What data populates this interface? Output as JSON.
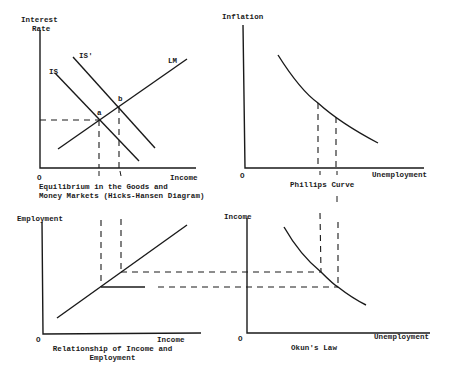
{
  "panels": {
    "hicks_hansen": {
      "y_axis_label_line1": "Interest",
      "y_axis_label_line2": "Rate",
      "x_axis_label": "Income",
      "origin": "O",
      "curves": {
        "is": "IS",
        "is_shifted": "IS'",
        "lm": "LM"
      },
      "points": {
        "a": "a",
        "b": "b"
      },
      "caption_line1": "Equilibrium in the Goods and",
      "caption_line2": "Money Markets (Hicks-Hansen Diagram)"
    },
    "phillips": {
      "y_axis_label": "Inflation",
      "x_axis_label": "Unemployment",
      "origin": "O",
      "caption": "Phillips Curve"
    },
    "income_employment": {
      "y_axis_label": "Employment",
      "x_axis_label": "Income",
      "origin": "O",
      "caption_line1": "Relationship of Income and",
      "caption_line2": "Employment"
    },
    "okun": {
      "y_axis_label": "Income",
      "x_axis_label": "Unemployment",
      "origin": "O",
      "caption": "Okun's Law"
    }
  },
  "colors": {
    "ink": "#1a1a1a",
    "background": "#ffffff"
  }
}
